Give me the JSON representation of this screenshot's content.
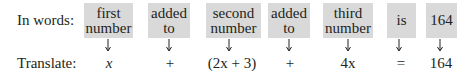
{
  "row_labels": {
    "words": "In words:",
    "translate": "Translate:"
  },
  "columns": [
    {
      "words_line1": "first",
      "words_line2": "number",
      "translation": "x"
    },
    {
      "words_line1": "added",
      "words_line2": "to",
      "translation": "+"
    },
    {
      "words_line1": "second",
      "words_line2": "number",
      "translation": "(2x + 3)"
    },
    {
      "words_line1": "added",
      "words_line2": "to",
      "translation": "+"
    },
    {
      "words_line1": "third",
      "words_line2": "number",
      "translation": "4x"
    },
    {
      "words_line1": "is",
      "words_line2": "",
      "translation": "="
    },
    {
      "words_line1": "164",
      "words_line2": "",
      "translation": "164"
    }
  ],
  "colors": {
    "box_fill": "#d9d9d9",
    "text": "#231f20"
  }
}
